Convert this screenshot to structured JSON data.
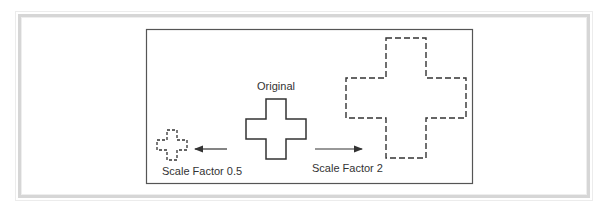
{
  "figure": {
    "labels": {
      "original": "Original",
      "scale_half": "Scale Factor 0.5",
      "scale_double": "Scale Factor 2"
    },
    "shapes": [
      {
        "name": "original-cross",
        "style": "solid",
        "scale_factor": 1
      },
      {
        "name": "scaled-cross-half",
        "style": "dashed",
        "scale_factor": 0.5
      },
      {
        "name": "scaled-cross-double",
        "style": "dashed",
        "scale_factor": 2
      }
    ],
    "arrows": [
      {
        "name": "arrow-to-half",
        "direction": "left"
      },
      {
        "name": "arrow-to-double",
        "direction": "right"
      }
    ],
    "colors": {
      "stroke": "#333333",
      "frame": "#d6d6d6"
    }
  }
}
